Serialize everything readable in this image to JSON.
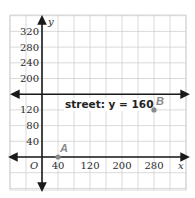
{
  "graph": {
    "x_axis_label": "x",
    "y_axis_label": "y",
    "origin_label": "O",
    "x_ticks": [
      {
        "value": 40,
        "label": "40"
      },
      {
        "value": 120,
        "label": "120"
      },
      {
        "value": 200,
        "label": "200"
      },
      {
        "value": 280,
        "label": "280"
      }
    ],
    "y_ticks": [
      {
        "value": 40,
        "label": "40"
      },
      {
        "value": 80,
        "label": "80"
      },
      {
        "value": 120,
        "label": "120"
      },
      {
        "value": 200,
        "label": "200"
      },
      {
        "value": 240,
        "label": "240"
      },
      {
        "value": 280,
        "label": "280"
      },
      {
        "value": 320,
        "label": "320"
      }
    ],
    "grid_step": 40,
    "street": {
      "label": "street: y = 160",
      "y": 160
    },
    "points": [
      {
        "name": "A",
        "x": 40,
        "y": 0
      },
      {
        "name": "B",
        "x": 280,
        "y": 120
      }
    ],
    "colors": {
      "grid": "#d0d0d0",
      "axis": "#1a1a1a",
      "point": "#8a8a8a"
    }
  }
}
